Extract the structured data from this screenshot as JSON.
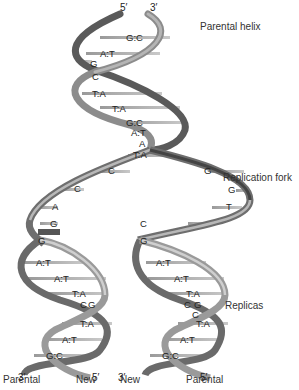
{
  "labels": {
    "parental_helix": "Parental helix",
    "replication_fork": "Replication fork",
    "replicas": "Replicas"
  },
  "strand_ends": {
    "top_5": "5′",
    "top_3": "3′",
    "left_bottom_3": "3′",
    "left_bottom_5": "5′",
    "right_bottom_3": "3′",
    "right_bottom_5": "5′"
  },
  "bottom_labels": [
    "Parental",
    "New",
    "New",
    "Parental"
  ],
  "parental_helix_pairs": [
    "G:C",
    "A:T",
    "G",
    "C",
    "T:A",
    "T:A",
    "G:C",
    "A:T",
    "A",
    "T:A"
  ],
  "fork_left_bases": [
    "C",
    "C",
    "A",
    "G",
    "G"
  ],
  "fork_right_bases": [
    "G",
    "G",
    "T",
    "C",
    "G"
  ],
  "left_replica_pairs": [
    "A:T",
    "A:T",
    "T:A",
    "C",
    "G",
    "T:A",
    "A:T",
    "G:C"
  ],
  "right_replica_pairs": [
    "A:T",
    "A:T",
    "T:A",
    "C",
    "G",
    "C",
    "T:A",
    "A:T",
    "G:C"
  ],
  "colors": {
    "ribbon_dark": "#4a4a4a",
    "ribbon_mid": "#8a8a8a",
    "ribbon_light": "#c8c8c8",
    "rung": "#9a9a9a",
    "text": "#222222"
  }
}
